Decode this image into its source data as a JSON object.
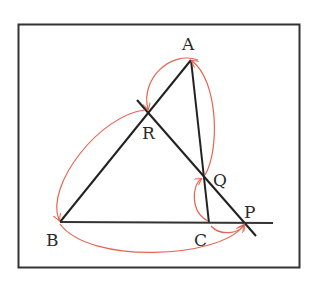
{
  "diagram": {
    "type": "geometry",
    "frame": {
      "x": 18,
      "y": 24,
      "width": 281,
      "height": 243
    },
    "colors": {
      "line": "#222222",
      "arc": "#e8634f",
      "frame": "#333333"
    },
    "points": {
      "A": {
        "label": "A",
        "x": 191,
        "y": 60,
        "label_x": 188,
        "label_y": 50
      },
      "B": {
        "label": "B",
        "x": 60,
        "y": 222,
        "label_x": 54,
        "label_y": 246
      },
      "C": {
        "label": "C",
        "x": 209,
        "y": 223,
        "label_x": 201,
        "label_y": 246
      },
      "P": {
        "label": "P",
        "x": 245,
        "y": 223,
        "label_x": 251,
        "label_y": 218
      },
      "Q": {
        "label": "Q",
        "x": 203,
        "y": 177,
        "label_x": 222,
        "label_y": 186
      },
      "R": {
        "label": "R",
        "x": 147,
        "y": 111,
        "label_x": 148,
        "label_y": 139
      }
    },
    "segments": [
      {
        "name": "AB",
        "from": "A",
        "to": "B"
      },
      {
        "name": "AC",
        "from": "A",
        "to": "C"
      },
      {
        "name": "BC-extended",
        "from": "B",
        "to": "P",
        "extends_to_x": 273
      },
      {
        "name": "RP-transversal",
        "from": "R",
        "to": "P",
        "extends": true
      }
    ],
    "arcs": [
      {
        "name": "arc-A-to-R",
        "from": "A",
        "to": "R"
      },
      {
        "name": "arc-Q-to-A",
        "from": "Q",
        "to": "A"
      },
      {
        "name": "arc-C-to-Q",
        "from": "C",
        "to": "Q"
      },
      {
        "name": "arc-C-to-P",
        "from": "C",
        "to": "P"
      },
      {
        "name": "arc-B-to-P",
        "from": "B",
        "to": "P"
      },
      {
        "name": "arc-R-to-B",
        "from": "R",
        "to": "B"
      }
    ]
  }
}
